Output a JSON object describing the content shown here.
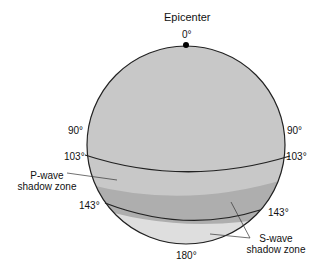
{
  "title": "Epicenter",
  "colors": {
    "upper": "#c8c8c8",
    "p_shadow": "#aeaeae",
    "s_zone": "#dedede",
    "outline": "#222222"
  },
  "labels": {
    "deg0": "0°",
    "deg90_left": "90°",
    "deg90_right": "90°",
    "deg103_left": "103°",
    "deg103_right": "103°",
    "deg143_left": "143°",
    "deg143_right": "143°",
    "deg180": "180°",
    "p_wave_line1": "P-wave",
    "p_wave_line2": "shadow zone",
    "s_wave_line1": "S-wave",
    "s_wave_line2": "shadow zone"
  }
}
